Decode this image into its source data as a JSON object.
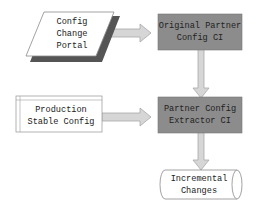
{
  "diagram": {
    "nodes": [
      {
        "id": "config-change-portal",
        "shape": "parallelogram",
        "lines": [
          "Config",
          "Change",
          "Portal"
        ]
      },
      {
        "id": "original-partner-config-ci",
        "shape": "rectangle",
        "lines": [
          "Original Partner",
          "Config CI"
        ]
      },
      {
        "id": "production-stable-config",
        "shape": "rectangle-banded",
        "lines": [
          "Production",
          "Stable Config"
        ]
      },
      {
        "id": "partner-config-extractor-ci",
        "shape": "rectangle",
        "lines": [
          "Partner Config",
          "Extractor CI"
        ]
      },
      {
        "id": "incremental-changes",
        "shape": "cylinder-horizontal",
        "lines": [
          "Incremental",
          "Changes"
        ]
      }
    ],
    "edges": [
      {
        "from": "config-change-portal",
        "to": "original-partner-config-ci"
      },
      {
        "from": "original-partner-config-ci",
        "to": "partner-config-extractor-ci"
      },
      {
        "from": "production-stable-config",
        "to": "partner-config-extractor-ci"
      },
      {
        "from": "partner-config-extractor-ci",
        "to": "incremental-changes"
      }
    ],
    "colors": {
      "process_fill": "#8c8c8c",
      "shadow": "#555555",
      "arrow_fill": "#d6d6d6",
      "arrow_stroke": "#a8a8a8",
      "outline": "#9a9a9a"
    }
  }
}
